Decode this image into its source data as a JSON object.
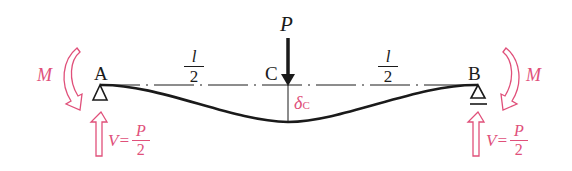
{
  "diagram": {
    "type": "simply-supported beam with center point load",
    "colors": {
      "beam": "#1a1a1a",
      "annotation": "#e0507a"
    },
    "points": {
      "A": "A",
      "B": "B",
      "C": "C"
    },
    "load": {
      "label": "P"
    },
    "spans": {
      "left": {
        "num": "l",
        "den": "2"
      },
      "right": {
        "num": "l",
        "den": "2"
      }
    },
    "deflection": {
      "symbol": "δ",
      "subscript": "C"
    },
    "moments": {
      "left": "M",
      "right": "M"
    },
    "reactions": {
      "left": {
        "prefix": "V=",
        "num": "P",
        "den": "2"
      },
      "right": {
        "prefix": "V=",
        "num": "P",
        "den": "2"
      }
    }
  }
}
